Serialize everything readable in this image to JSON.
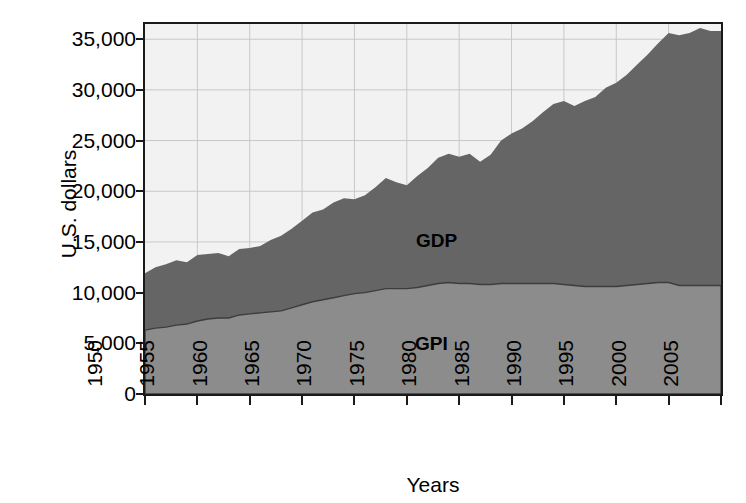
{
  "chart_data": {
    "type": "area",
    "stacked": false,
    "title": "",
    "xlabel": "Years",
    "ylabel": "U.S. dollars",
    "xlim": [
      1950,
      2005
    ],
    "ylim": [
      0,
      36500
    ],
    "xticks": [
      1950,
      1955,
      1960,
      1965,
      1970,
      1975,
      1980,
      1985,
      1990,
      1995,
      2000,
      2005
    ],
    "xticklabels": [
      "1950",
      "1955",
      "1960",
      "1965",
      "1970",
      "1975",
      "1980",
      "1985",
      "1990",
      "1995",
      "2000",
      "2005"
    ],
    "yticks": [
      0,
      5000,
      10000,
      15000,
      20000,
      25000,
      30000,
      35000
    ],
    "yticklabels": [
      "0",
      "5,000",
      "10,000",
      "15,000",
      "20,000",
      "25,000",
      "30,000",
      "35,000"
    ],
    "grid": true,
    "legend_position": "inline-area-labels",
    "annotations": [
      {
        "text": "GDP",
        "x": 1979,
        "y": 16200
      },
      {
        "text": "GPI",
        "x": 1979,
        "y": 5600
      }
    ],
    "colors": {
      "gdp_area": "#656565",
      "gpi_area": "#8c8c8c",
      "plot_background": "#f2f2f2",
      "gridline": "#c8c8c8",
      "axis": "#1a1a1a",
      "text": "#000000",
      "page_background": "#ffffff"
    },
    "x": [
      1950,
      1951,
      1952,
      1953,
      1954,
      1955,
      1956,
      1957,
      1958,
      1959,
      1960,
      1961,
      1962,
      1963,
      1964,
      1965,
      1966,
      1967,
      1968,
      1969,
      1970,
      1971,
      1972,
      1973,
      1974,
      1975,
      1976,
      1977,
      1978,
      1979,
      1980,
      1981,
      1982,
      1983,
      1984,
      1985,
      1986,
      1987,
      1988,
      1989,
      1990,
      1991,
      1992,
      1993,
      1994,
      1995,
      1996,
      1997,
      1998,
      1999,
      2000,
      2001,
      2002,
      2003,
      2004
    ],
    "series": [
      {
        "name": "GDP",
        "label": "GDP",
        "color": "#656565",
        "values": [
          11900,
          12500,
          12800,
          13200,
          13000,
          13700,
          13800,
          13900,
          13600,
          14300,
          14400,
          14600,
          15200,
          15600,
          16300,
          17100,
          17900,
          18200,
          18900,
          19300,
          19200,
          19600,
          20400,
          21300,
          20900,
          20600,
          21500,
          22300,
          23300,
          23700,
          23400,
          23700,
          22900,
          23600,
          25000,
          25700,
          26200,
          26900,
          27800,
          28600,
          28900,
          28400,
          28900,
          29300,
          30200,
          30700,
          31500,
          32500,
          33500,
          34600,
          35600,
          35400,
          35600,
          36100,
          35800
        ]
      },
      {
        "name": "GPI",
        "label": "GPI",
        "color": "#8c8c8c",
        "values": [
          6300,
          6500,
          6600,
          6800,
          6900,
          7200,
          7400,
          7500,
          7500,
          7800,
          7900,
          8000,
          8100,
          8200,
          8500,
          8800,
          9100,
          9300,
          9500,
          9700,
          9900,
          10000,
          10200,
          10400,
          10400,
          10400,
          10500,
          10700,
          10900,
          11000,
          10900,
          10900,
          10800,
          10800,
          10900,
          10900,
          10900,
          10900,
          10900,
          10900,
          10800,
          10700,
          10600,
          10600,
          10600,
          10600,
          10700,
          10800,
          10900,
          11000,
          11000,
          10700,
          10700,
          10700,
          10700
        ]
      }
    ]
  }
}
